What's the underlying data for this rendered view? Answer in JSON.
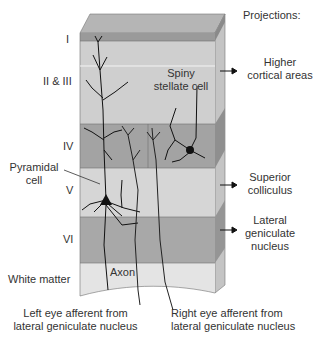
{
  "diagram": {
    "layers": [
      {
        "label": "I",
        "color": "#9a9a9a"
      },
      {
        "label": "II & III",
        "color": "#cfcfcf"
      },
      {
        "label": "IV",
        "color": "#a3a3a3"
      },
      {
        "label": "V",
        "color": "#d6d6d6"
      },
      {
        "label": "VI",
        "color": "#a8a8a8"
      },
      {
        "label": "White matter",
        "color": "#e4e4e4"
      }
    ],
    "projections_header": "Projections:",
    "projections": [
      {
        "line1": "Higher",
        "line2": "cortical areas"
      },
      {
        "line1": "Superior",
        "line2": "colliculus"
      },
      {
        "line1": "Lateral",
        "line2": "geniculate",
        "line3": "nucleus"
      }
    ],
    "cells": {
      "spiny_line1": "Spiny",
      "spiny_line2": "stellate cell",
      "pyramidal_line1": "Pyramidal",
      "pyramidal_line2": "cell",
      "axon": "Axon"
    },
    "afferents": {
      "left_line1": "Left eye afferent from",
      "left_line2": "lateral geniculate nucleus",
      "right_line1": "Right eye afferent from",
      "right_line2": "lateral geniculate nucleus"
    }
  }
}
